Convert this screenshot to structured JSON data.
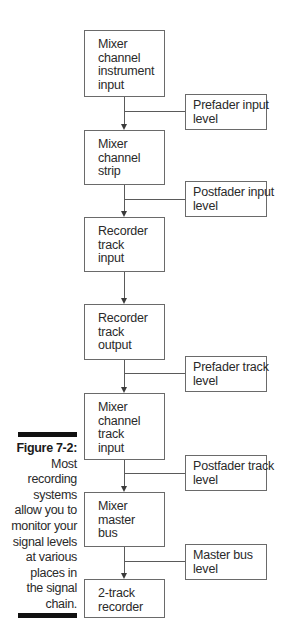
{
  "diagram": {
    "type": "flowchart",
    "main_flow": [
      {
        "id": "mixer_channel_instrument_input",
        "lines": [
          "Mixer",
          "channel",
          "instrument",
          "input"
        ]
      },
      {
        "id": "mixer_channel_strip",
        "lines": [
          "Mixer",
          "channel",
          "strip"
        ]
      },
      {
        "id": "recorder_track_input",
        "lines": [
          "Recorder",
          "track",
          "input"
        ]
      },
      {
        "id": "recorder_track_output",
        "lines": [
          "Recorder",
          "track",
          "output"
        ]
      },
      {
        "id": "mixer_channel_track_input",
        "lines": [
          "Mixer",
          "channel",
          "track",
          "input"
        ]
      },
      {
        "id": "mixer_master_bus",
        "lines": [
          "Mixer",
          "master",
          "bus"
        ]
      },
      {
        "id": "two_track_recorder",
        "lines": [
          "2-track",
          "recorder"
        ]
      }
    ],
    "monitor_points": [
      {
        "id": "prefader_input_level",
        "lines": [
          "Prefader input",
          "level"
        ],
        "between": [
          "mixer_channel_instrument_input",
          "mixer_channel_strip"
        ]
      },
      {
        "id": "postfader_input_level",
        "lines": [
          "Postfader input",
          "level"
        ],
        "between": [
          "mixer_channel_strip",
          "recorder_track_input"
        ]
      },
      {
        "id": "prefader_track_level",
        "lines": [
          "Prefader track",
          "level"
        ],
        "between": [
          "recorder_track_output",
          "mixer_channel_track_input"
        ]
      },
      {
        "id": "postfader_track_level",
        "lines": [
          "Postfader track",
          "level"
        ],
        "between": [
          "mixer_channel_track_input",
          "mixer_master_bus"
        ]
      },
      {
        "id": "master_bus_level",
        "lines": [
          "Master bus",
          "level"
        ],
        "between": [
          "mixer_master_bus",
          "two_track_recorder"
        ]
      }
    ]
  },
  "caption": {
    "label": "Figure 7-2:",
    "lines": [
      "Most",
      "recording",
      "systems",
      "allow you to",
      "monitor your",
      "signal levels",
      "at various",
      "places in",
      "the signal",
      "chain."
    ]
  }
}
